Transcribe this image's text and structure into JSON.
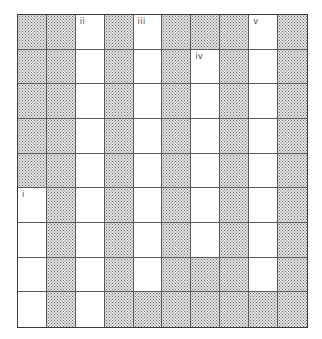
{
  "diagram": {
    "title": "",
    "columns": 10,
    "rows": 9,
    "legend": {
      "S": "shaded (stippled) cell",
      "W": "white cell"
    },
    "cells": [
      [
        "S",
        "S",
        "W",
        "S",
        "W",
        "S",
        "S",
        "S",
        "W",
        "S"
      ],
      [
        "S",
        "S",
        "W",
        "S",
        "W",
        "S",
        "W",
        "S",
        "W",
        "S"
      ],
      [
        "S",
        "S",
        "W",
        "S",
        "W",
        "S",
        "W",
        "S",
        "W",
        "S"
      ],
      [
        "S",
        "S",
        "W",
        "S",
        "W",
        "S",
        "W",
        "S",
        "W",
        "S"
      ],
      [
        "S",
        "S",
        "W",
        "S",
        "W",
        "S",
        "W",
        "S",
        "W",
        "S"
      ],
      [
        "W",
        "S",
        "W",
        "S",
        "W",
        "S",
        "W",
        "S",
        "W",
        "S"
      ],
      [
        "W",
        "S",
        "W",
        "S",
        "W",
        "S",
        "W",
        "S",
        "W",
        "S"
      ],
      [
        "W",
        "S",
        "W",
        "S",
        "W",
        "S",
        "S",
        "S",
        "W",
        "S"
      ],
      [
        "W",
        "S",
        "W",
        "S",
        "S",
        "S",
        "S",
        "S",
        "S",
        "S"
      ]
    ],
    "labels": [
      {
        "text": "i",
        "row": 5,
        "col": 0
      },
      {
        "text": "ii",
        "row": 0,
        "col": 2
      },
      {
        "text": "iii",
        "row": 0,
        "col": 4
      },
      {
        "text": "iv",
        "row": 1,
        "col": 6
      },
      {
        "text": "v",
        "row": 0,
        "col": 8
      }
    ],
    "colors": {
      "border": "#3a3a3a",
      "shade_dot": "#6a6a6a",
      "shade_bg": "#e4e4e4",
      "white": "#ffffff"
    }
  }
}
